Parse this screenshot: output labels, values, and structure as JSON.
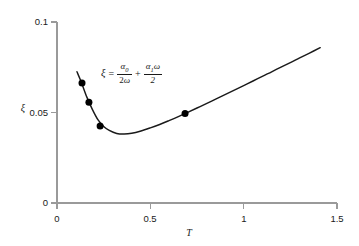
{
  "chart_data": {
    "type": "line",
    "title": "",
    "xlabel": "T",
    "ylabel": "ξ",
    "xlim": [
      0,
      1.5
    ],
    "ylim": [
      0,
      0.1
    ],
    "xticks": [
      "0",
      "0.5",
      "1",
      "1.5"
    ],
    "xtick_values": [
      0,
      0.5,
      1,
      1.5
    ],
    "yticks": [
      "0",
      "0.05",
      "0.1"
    ],
    "ytick_values": [
      0,
      0.05,
      0.1
    ],
    "grid": false,
    "legend": null,
    "series": [
      {
        "name": "Rayleigh damping ratio",
        "type": "line",
        "color": "#1a1a1a",
        "x": [
          0.107,
          0.13,
          0.16,
          0.19,
          0.22,
          0.25,
          0.28,
          0.32,
          0.36,
          0.4,
          0.45,
          0.5,
          0.55,
          0.6,
          0.65,
          0.7,
          0.75,
          0.8,
          0.85,
          0.9,
          0.95,
          1.0,
          1.05,
          1.1,
          1.15,
          1.2,
          1.25,
          1.3,
          1.35,
          1.41
        ],
        "y": [
          0.0725,
          0.0668,
          0.0585,
          0.0516,
          0.0459,
          0.0423,
          0.0401,
          0.0384,
          0.0381,
          0.0385,
          0.0398,
          0.0415,
          0.0434,
          0.0455,
          0.0477,
          0.0501,
          0.0525,
          0.0549,
          0.0574,
          0.0599,
          0.0624,
          0.0649,
          0.0674,
          0.07,
          0.0725,
          0.0751,
          0.0776,
          0.0802,
          0.0827,
          0.0858
        ]
      },
      {
        "name": "Modal data points",
        "type": "scatter",
        "color": "#000000",
        "x": [
          0.134,
          0.171,
          0.231,
          0.686
        ],
        "y": [
          0.0663,
          0.0557,
          0.0425,
          0.0494
        ]
      }
    ],
    "annotations": [
      {
        "name": "damping-equation",
        "text": "ξ = α₀/(2ω) + α₁ω/2",
        "x": 0.24,
        "y": 0.0775
      }
    ]
  },
  "axes": {
    "y_axis_label": "ξ",
    "x_axis_label": "T",
    "y_tick_labels": [
      "0.1",
      "0.05",
      "0"
    ],
    "x_tick_labels": [
      "0",
      "0.5",
      "1",
      "1.5"
    ]
  },
  "equation": {
    "lhs": "ξ",
    "equals": "=",
    "term1_numerator": "α",
    "term1_numerator_sub": "0",
    "term1_denominator_coeff": "2",
    "term1_denominator_sym": "ω",
    "plus": "+",
    "term2_numerator_sym": "α",
    "term2_numerator_sub": "1",
    "term2_numerator_omega": "ω",
    "term2_denominator": "2"
  },
  "colors": {
    "curve": "#1a1a1a",
    "marker": "#000000",
    "axis": "#9a9a9a",
    "background": "#ffffff",
    "text": "#1a1a1a"
  }
}
